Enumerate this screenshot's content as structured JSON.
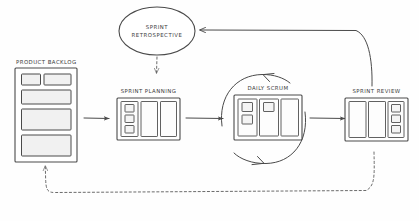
{
  "diagram": {
    "background_color": "#fefefe",
    "line_color": "#4a4a4a",
    "card_fill_color": "#f1f1f1"
  },
  "nodes": {
    "product_backlog": {
      "label": "PRODUCT BACKLOG",
      "shape": "stacked-cards",
      "card_count": 5
    },
    "sprint_planning": {
      "label": "SPRINT PLANNING",
      "shape": "board",
      "columns": 3,
      "notes_in_first_column": 3
    },
    "daily_scrum": {
      "label": "DAILY SCRUM",
      "shape": "board-in-circle",
      "columns": 3,
      "notes_column_one": 2,
      "notes_column_two": 1,
      "notes_column_three": 0
    },
    "sprint_review": {
      "label": "SPRINT REVIEW",
      "shape": "board",
      "columns": 3,
      "notes_in_last_column": 3
    },
    "sprint_retrospective": {
      "label_line_1": "SPRINT",
      "label_line_2": "RETROSPECTIVE",
      "shape": "ellipse"
    }
  },
  "connectors": [
    {
      "name": "backlog-to-planning",
      "from": "product_backlog",
      "to": "sprint_planning",
      "style": "solid",
      "arrow": "end"
    },
    {
      "name": "planning-to-scrum",
      "from": "sprint_planning",
      "to": "daily_scrum",
      "style": "solid",
      "arrow": "end"
    },
    {
      "name": "scrum-to-review",
      "from": "daily_scrum",
      "to": "sprint_review",
      "style": "solid",
      "arrow": "end"
    },
    {
      "name": "daily-scrum-loop",
      "from": "daily_scrum",
      "to": "daily_scrum",
      "style": "solid",
      "arrow": "both"
    },
    {
      "name": "review-to-retrospective",
      "from": "sprint_review",
      "to": "sprint_retrospective",
      "style": "solid",
      "arrow": "end"
    },
    {
      "name": "retrospective-to-planning",
      "from": "sprint_retrospective",
      "to": "sprint_planning",
      "style": "dashed",
      "arrow": "end"
    },
    {
      "name": "review-to-backlog",
      "from": "sprint_review",
      "to": "product_backlog",
      "style": "dashed",
      "arrow": "end"
    }
  ]
}
